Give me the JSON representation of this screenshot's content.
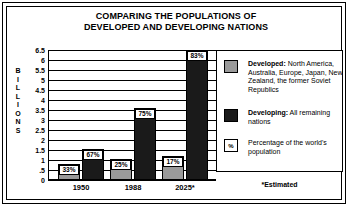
{
  "title": {
    "line1": "COMPARING THE POPULATIONS OF",
    "line2": "DEVELOPED AND DEVELOPING NATIONS"
  },
  "axis": {
    "y_title": "BILLIONS",
    "y_title_letters": [
      "B",
      "I",
      "L",
      "L",
      "I",
      "O",
      "N",
      "S"
    ],
    "y_ticks": [
      "6.5",
      "6",
      "5.5",
      "5",
      "4.5",
      "4",
      "3.5",
      "3",
      "2.5",
      "2",
      "1.5",
      "1",
      ".5",
      "0"
    ],
    "x_labels": [
      "1950",
      "1988",
      "2025*"
    ]
  },
  "legend": {
    "items": [
      {
        "swatch": "grey",
        "swatch_label": "",
        "text": "Developed: North America, Australia, Europe, Japan, New Zealand, the former Soviet Republics",
        "bold_prefix": "Developed:",
        "rest": " North America, Australia, Europe, Japan, New Zealand, the former Soviet Republics"
      },
      {
        "swatch": "black",
        "swatch_label": "",
        "text": "Developing: All remaining nations",
        "bold_prefix": "Developing:",
        "rest": " All remaining nations"
      },
      {
        "swatch": "pctbox",
        "swatch_label": "%",
        "text": "Percentage of the world's population",
        "bold_prefix": "",
        "rest": "Percentage of the world's population"
      }
    ]
  },
  "footnote": "*Estimated",
  "colors": {
    "developed": "#9a9a9a",
    "developing": "#1a1a1a",
    "background": "#ffffff",
    "ink": "#000000"
  },
  "chart_data": {
    "type": "bar",
    "title": "COMPARING THE POPULATIONS OF DEVELOPED AND DEVELOPING NATIONS",
    "xlabel": "",
    "ylabel": "BILLIONS",
    "ylim": [
      0,
      6.5
    ],
    "ytick_step": 0.5,
    "grid": true,
    "legend_position": "right",
    "categories": [
      "1950",
      "1988",
      "2025*"
    ],
    "series": [
      {
        "name": "Developed",
        "values": [
          0.8,
          1.05,
          1.2
        ],
        "labels": [
          "33%",
          "25%",
          "17%"
        ],
        "color": "#9a9a9a"
      },
      {
        "name": "Developing",
        "values": [
          1.55,
          3.6,
          6.5
        ],
        "labels": [
          "67%",
          "75%",
          "83%"
        ],
        "color": "#1a1a1a"
      }
    ],
    "annotations": [
      "*Estimated"
    ]
  }
}
